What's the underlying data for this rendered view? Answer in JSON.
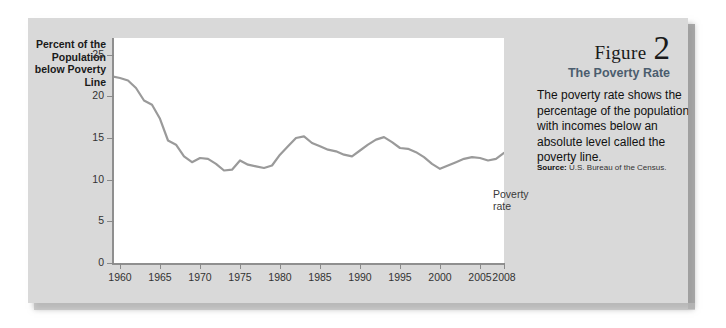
{
  "figure": {
    "number_word": "Figure",
    "number": "2",
    "title": "The Poverty Rate",
    "body": "The poverty rate shows the percentage of the population with incomes below an absolute level called the poverty line.",
    "source_label": "Source:",
    "source_text": "U.S. Bureau of the Census."
  },
  "colors": {
    "panel_background": "#d9d9d9",
    "plot_background": "#ffffff",
    "line": "#9a9a9a",
    "axis": "#8f8f8f",
    "title_accent": "#4b5d6e",
    "text": "#111111"
  },
  "chart_data": {
    "type": "line",
    "title": "The Poverty Rate",
    "xlabel": "",
    "ylabel": "Percent of the\nPopulation\nbelow Poverty\nLine",
    "series_label": "Poverty rate",
    "xlim": [
      1959,
      2008
    ],
    "ylim": [
      0,
      27
    ],
    "yticks": [
      0,
      5,
      10,
      15,
      20,
      25
    ],
    "xticks": [
      1960,
      1965,
      1970,
      1975,
      1980,
      1985,
      1990,
      1995,
      2000,
      2005,
      2008
    ],
    "xticklabels": [
      "1960",
      "1965",
      "1970",
      "1975",
      "1980",
      "1985",
      "1990",
      "1995",
      "2000",
      "2005",
      "2008"
    ],
    "grid": false,
    "legend": "inline-label",
    "x": [
      1959,
      1960,
      1961,
      1962,
      1963,
      1964,
      1965,
      1966,
      1967,
      1968,
      1969,
      1970,
      1971,
      1972,
      1973,
      1974,
      1975,
      1976,
      1977,
      1978,
      1979,
      1980,
      1981,
      1982,
      1983,
      1984,
      1985,
      1986,
      1987,
      1988,
      1989,
      1990,
      1991,
      1992,
      1993,
      1994,
      1995,
      1996,
      1997,
      1998,
      1999,
      2000,
      2001,
      2002,
      2003,
      2004,
      2005,
      2006,
      2007,
      2008
    ],
    "values": [
      22.4,
      22.2,
      21.9,
      21.0,
      19.5,
      19.0,
      17.3,
      14.7,
      14.2,
      12.8,
      12.1,
      12.6,
      12.5,
      11.9,
      11.1,
      11.2,
      12.3,
      11.8,
      11.6,
      11.4,
      11.7,
      13.0,
      14.0,
      15.0,
      15.2,
      14.4,
      14.0,
      13.6,
      13.4,
      13.0,
      12.8,
      13.5,
      14.2,
      14.8,
      15.1,
      14.5,
      13.8,
      13.7,
      13.3,
      12.7,
      11.9,
      11.3,
      11.7,
      12.1,
      12.5,
      12.7,
      12.6,
      12.3,
      12.5,
      13.2
    ]
  }
}
